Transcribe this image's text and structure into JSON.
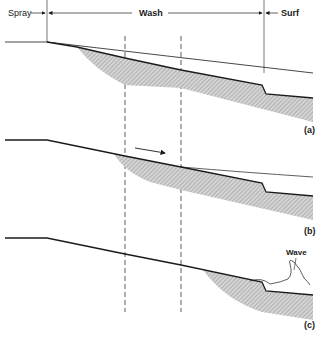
{
  "zones": {
    "spray": "Spray",
    "wash": "Wash",
    "surf": "Surf"
  },
  "panels": [
    {
      "id": "a",
      "label": "(a)"
    },
    {
      "id": "b",
      "label": "(b)"
    },
    {
      "id": "c",
      "label": "(c)"
    }
  ],
  "annotations": {
    "wave": "Wave"
  },
  "colors": {
    "line": "#1a1a1a",
    "shading": "#bdbdbd",
    "background": "#ffffff"
  }
}
